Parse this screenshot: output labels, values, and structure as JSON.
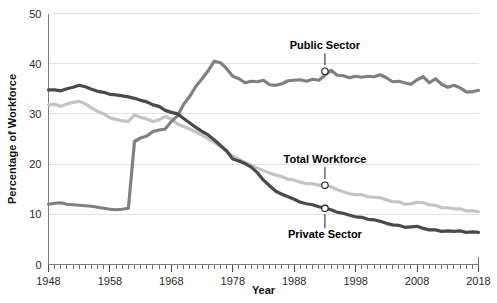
{
  "chart_data": {
    "type": "line",
    "title": "",
    "xlabel": "Year",
    "ylabel": "Percentage of Workforce",
    "xlim": [
      1948,
      2018
    ],
    "ylim": [
      0,
      50
    ],
    "grid": true,
    "legend_position": "inline-annotations",
    "y_ticks": [
      0,
      10,
      20,
      30,
      40,
      50
    ],
    "x_ticks": [
      1948,
      1958,
      1968,
      1978,
      1988,
      1998,
      2008,
      2018
    ],
    "x_minor_tick_step": 1,
    "annotations": [
      {
        "text": "Public Sector",
        "series": "Public Sector",
        "x": 1993,
        "y": 38.5
      },
      {
        "text": "Total  Workforce",
        "series": "Total Workforce",
        "x": 1993,
        "y": 15.8
      },
      {
        "text": "Private Sector",
        "series": "Private Sector",
        "x": 1993,
        "y": 11.2
      }
    ],
    "colors": {
      "public_sector": "#808080",
      "total_workforce": "#c4c4c4",
      "private_sector": "#4a4a4a",
      "gridline": "#e2e2e2",
      "axis": "#7d7d7d",
      "text": "#111111"
    },
    "x": [
      1948,
      1949,
      1950,
      1951,
      1952,
      1953,
      1954,
      1955,
      1956,
      1957,
      1958,
      1959,
      1960,
      1961,
      1962,
      1963,
      1964,
      1965,
      1966,
      1967,
      1968,
      1969,
      1970,
      1971,
      1972,
      1973,
      1974,
      1975,
      1976,
      1977,
      1978,
      1979,
      1980,
      1981,
      1982,
      1983,
      1984,
      1985,
      1986,
      1987,
      1988,
      1989,
      1990,
      1991,
      1992,
      1993,
      1994,
      1995,
      1996,
      1997,
      1998,
      1999,
      2000,
      2001,
      2002,
      2003,
      2004,
      2005,
      2006,
      2007,
      2008,
      2009,
      2010,
      2011,
      2012,
      2013,
      2014,
      2015,
      2016,
      2017,
      2018
    ],
    "series": [
      {
        "name": "Public Sector",
        "color": "#808080",
        "values": [
          12.0,
          12.2,
          12.3,
          12.0,
          11.9,
          11.8,
          11.7,
          11.6,
          11.4,
          11.2,
          11.0,
          10.9,
          11.0,
          11.2,
          24.5,
          25.2,
          25.6,
          26.5,
          26.8,
          27.0,
          28.5,
          29.6,
          31.9,
          33.5,
          35.5,
          37.0,
          38.6,
          40.5,
          40.2,
          39.0,
          37.5,
          37.0,
          36.2,
          36.5,
          36.4,
          36.7,
          35.8,
          35.7,
          36.0,
          36.6,
          36.7,
          36.8,
          36.5,
          36.9,
          36.7,
          37.7,
          38.7,
          37.7,
          37.6,
          37.2,
          37.5,
          37.3,
          37.5,
          37.4,
          37.8,
          37.2,
          36.4,
          36.5,
          36.2,
          35.9,
          36.8,
          37.4,
          36.2,
          37.0,
          35.9,
          35.3,
          35.7,
          35.2,
          34.4,
          34.4,
          34.7
        ]
      },
      {
        "name": "Total Workforce",
        "color": "#c4c4c4",
        "values": [
          31.8,
          31.9,
          31.5,
          32.0,
          32.3,
          32.5,
          32.0,
          31.2,
          30.5,
          30.0,
          29.2,
          28.9,
          28.6,
          28.5,
          29.8,
          29.3,
          29.0,
          28.5,
          28.8,
          29.5,
          29.0,
          28.0,
          27.5,
          27.0,
          26.4,
          25.8,
          25.0,
          24.3,
          23.5,
          22.7,
          21.5,
          21.0,
          20.3,
          19.8,
          19.2,
          18.7,
          18.2,
          17.8,
          17.5,
          17.0,
          16.8,
          16.4,
          16.1,
          16.1,
          15.8,
          15.8,
          15.5,
          14.9,
          14.5,
          14.1,
          13.9,
          13.9,
          13.5,
          13.4,
          13.3,
          12.9,
          12.5,
          12.5,
          12.0,
          12.1,
          12.4,
          12.3,
          11.9,
          11.8,
          11.3,
          11.3,
          11.1,
          11.1,
          10.7,
          10.7,
          10.5
        ]
      },
      {
        "name": "Private Sector",
        "color": "#4a4a4a",
        "values": [
          34.8,
          34.8,
          34.6,
          35.0,
          35.3,
          35.7,
          35.4,
          34.9,
          34.5,
          34.3,
          33.9,
          33.8,
          33.6,
          33.4,
          33.1,
          32.7,
          32.4,
          31.8,
          31.5,
          30.7,
          30.3,
          30.0,
          29.1,
          28.2,
          27.3,
          26.5,
          25.8,
          24.8,
          23.7,
          22.6,
          21.0,
          20.6,
          20.1,
          19.4,
          18.3,
          16.8,
          15.7,
          14.6,
          14.0,
          13.5,
          13.0,
          12.4,
          12.1,
          11.9,
          11.5,
          11.2,
          10.9,
          10.4,
          10.2,
          9.8,
          9.5,
          9.4,
          9.0,
          8.9,
          8.6,
          8.2,
          7.9,
          7.8,
          7.4,
          7.5,
          7.6,
          7.2,
          6.9,
          6.9,
          6.6,
          6.7,
          6.6,
          6.7,
          6.4,
          6.5,
          6.4
        ]
      }
    ]
  }
}
